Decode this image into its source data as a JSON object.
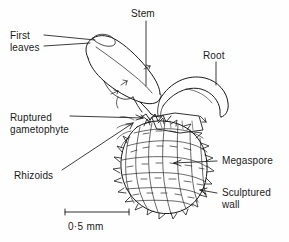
{
  "figure": {
    "background_color": "#fefefe",
    "ink_color": "#1a1a1a"
  },
  "labels": {
    "first_leaves_line1": "First",
    "first_leaves_line2": "leaves",
    "stem": "Stem",
    "root": "Root",
    "ruptured_line1": "Ruptured",
    "ruptured_line2": "gametophyte",
    "rhizoids": "Rhizoids",
    "megaspore": "Megaspore",
    "sculptured_line1": "Sculptured",
    "sculptured_line2": "wall"
  },
  "scale_bar": {
    "label": "0·5 mm",
    "value": "0.5",
    "unit": "mm"
  },
  "structures": [
    {
      "name": "first-leaves",
      "description": "pair of elongate first leaves pointing up and left"
    },
    {
      "name": "stem",
      "description": "short stem connecting leaves to megaspore"
    },
    {
      "name": "root",
      "description": "curved tapering root arcing right and down"
    },
    {
      "name": "ruptured-gametophyte",
      "description": "ruptured gametophyte flap at apex of megaspore"
    },
    {
      "name": "rhizoids",
      "description": "fine rhizoids at left shoulder of megaspore"
    },
    {
      "name": "megaspore",
      "description": "ovoid megaspore with reticulate polygonal surface"
    },
    {
      "name": "sculptured-wall",
      "description": "spiny sculptured outer wall of megaspore"
    }
  ]
}
